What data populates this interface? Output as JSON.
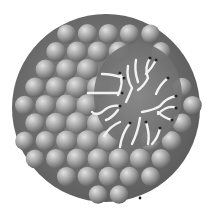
{
  "image": {
    "subject": "micelle",
    "description": "Spherical micelle made of grey lipid head-group spheres with a cutaway revealing white hydrophobic tails",
    "colors": {
      "background": "#ffffff",
      "sphere_light": "#d8d8d8",
      "sphere_mid": "#9a9a9a",
      "sphere_dark": "#555555",
      "tail": "#f2f2f2",
      "tail_tip": "#222222"
    }
  }
}
